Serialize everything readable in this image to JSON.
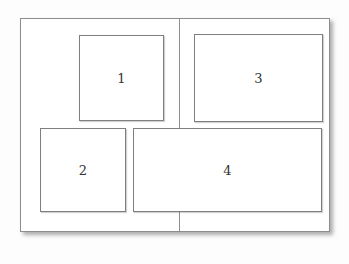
{
  "figure": {
    "background_color": "#fdfdfd",
    "frame": {
      "name": "page-frame",
      "border_color": "#8d8d8d",
      "fill_color": "#ffffff"
    },
    "divider": {
      "name": "vertical-divider",
      "orientation": "vertical",
      "color": "#8d8d8d"
    },
    "blocks": [
      {
        "id": "block-1",
        "label": "1",
        "column": "left",
        "row": "top",
        "border_color": "#7e7e7e",
        "fill_color": "#ffffff"
      },
      {
        "id": "block-2",
        "label": "2",
        "column": "left",
        "row": "bottom",
        "border_color": "#7e7e7e",
        "fill_color": "#ffffff"
      },
      {
        "id": "block-3",
        "label": "3",
        "column": "right",
        "row": "top",
        "border_color": "#7e7e7e",
        "fill_color": "#ffffff"
      },
      {
        "id": "block-4",
        "label": "4",
        "column": "spanning",
        "row": "bottom",
        "border_color": "#7e7e7e",
        "fill_color": "#ffffff"
      }
    ]
  }
}
